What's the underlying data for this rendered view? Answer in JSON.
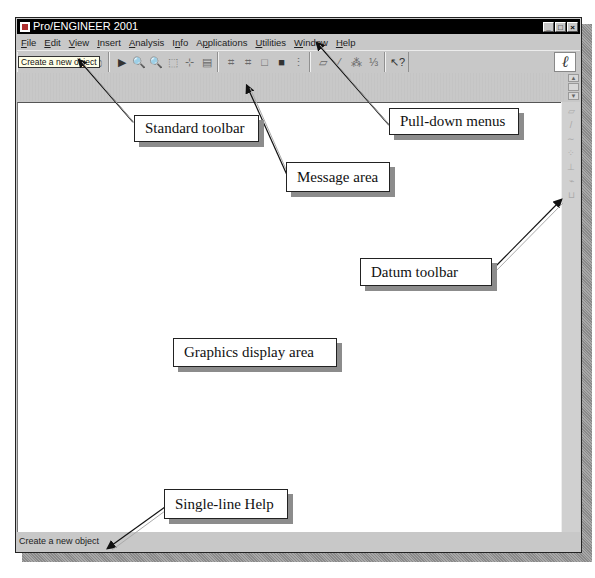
{
  "caption": "Pro/ENGINEER screen",
  "window": {
    "title": "Pro/ENGINEER 2001",
    "controls": [
      {
        "name": "minimize",
        "glyph": "_"
      },
      {
        "name": "maximize",
        "glyph": "□"
      },
      {
        "name": "close",
        "glyph": "×"
      }
    ]
  },
  "menubar": {
    "items": [
      {
        "label": "File",
        "u": "F",
        "rest": "ile"
      },
      {
        "label": "Edit",
        "u": "E",
        "rest": "dit"
      },
      {
        "label": "View",
        "u": "V",
        "rest": "iew"
      },
      {
        "label": "Insert",
        "u": "I",
        "rest": "nsert"
      },
      {
        "label": "Analysis",
        "u": "A",
        "rest": "nalysis"
      },
      {
        "label": "Info",
        "pre": "I",
        "u": "n",
        "rest": "fo"
      },
      {
        "label": "Applications",
        "pre": "A",
        "u": "p",
        "rest": "plications"
      },
      {
        "label": "Utilities",
        "u": "U",
        "rest": "tilities"
      },
      {
        "label": "Window",
        "u": "W",
        "rest": "indow"
      },
      {
        "label": "Help",
        "u": "H",
        "rest": "elp"
      }
    ]
  },
  "toolbar": {
    "tooltip": "Create a new object",
    "groups": [
      [
        {
          "name": "new-file-icon",
          "glyph": "🗋",
          "active": true
        },
        {
          "name": "open-file-icon",
          "glyph": "📂",
          "active": true
        },
        {
          "name": "save-icon",
          "glyph": "▣"
        },
        {
          "name": "save-copy-icon",
          "glyph": "⧉"
        },
        {
          "name": "print-icon",
          "glyph": "⎙"
        }
      ],
      [
        {
          "name": "repaint-icon",
          "glyph": "▶",
          "dark": true
        },
        {
          "name": "zoom-in-icon",
          "glyph": "🔍"
        },
        {
          "name": "zoom-out-icon",
          "glyph": "🔍"
        },
        {
          "name": "refit-icon",
          "glyph": "⬚"
        },
        {
          "name": "orient-icon",
          "glyph": "⊹"
        },
        {
          "name": "saved-views-icon",
          "glyph": "▤"
        }
      ],
      [
        {
          "name": "wireframe-icon",
          "glyph": "⌗"
        },
        {
          "name": "hidden-line-icon",
          "glyph": "⌗"
        },
        {
          "name": "no-hidden-icon",
          "glyph": "□"
        },
        {
          "name": "shading-icon",
          "glyph": "■",
          "dark": true
        },
        {
          "name": "model-tree-icon",
          "glyph": "⋮"
        }
      ],
      [
        {
          "name": "datum-planes-icon",
          "glyph": "▱"
        },
        {
          "name": "datum-axes-icon",
          "glyph": "⁄"
        },
        {
          "name": "datum-points-icon",
          "glyph": "⁂"
        },
        {
          "name": "coordinate-systems-icon",
          "glyph": "⅓"
        }
      ],
      [
        {
          "name": "context-help-icon",
          "glyph": "↖?",
          "dark": true
        }
      ]
    ],
    "logo_glyph": "ℓ"
  },
  "message_area": {
    "scroll_up": "▲",
    "scroll_down": "▼"
  },
  "datum_toolbar": {
    "items": [
      {
        "name": "datum-plane-tool-icon",
        "glyph": "▱"
      },
      {
        "name": "datum-axis-tool-icon",
        "glyph": "/"
      },
      {
        "name": "datum-curve-tool-icon",
        "glyph": "∼"
      },
      {
        "name": "datum-point-tool-icon",
        "glyph": "⁘"
      },
      {
        "name": "datum-csys-tool-icon",
        "glyph": "⊥"
      },
      {
        "name": "datum-analysis-tool-icon",
        "glyph": "⌁"
      },
      {
        "name": "datum-evaluate-tool-icon",
        "glyph": "⊔"
      }
    ]
  },
  "statusbar": {
    "text": "Create a new object"
  },
  "callouts": [
    {
      "id": "standard-toolbar",
      "label": "Standard toolbar"
    },
    {
      "id": "pull-down-menus",
      "label": "Pull-down menus"
    },
    {
      "id": "message-area",
      "label": "Message area"
    },
    {
      "id": "datum-toolbar",
      "label": "Datum toolbar"
    },
    {
      "id": "graphics-display-area",
      "label": "Graphics display area"
    },
    {
      "id": "single-line-help",
      "label": "Single-line Help"
    }
  ]
}
